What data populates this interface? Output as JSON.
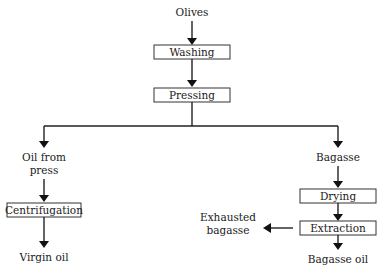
{
  "diagram": {
    "type": "flowchart",
    "nodes": {
      "olives": "Olives",
      "washing": "Washing",
      "pressing": "Pressing",
      "oil_from_press_1": "Oil from",
      "oil_from_press_2": "press",
      "centrifugation": "Centrifugation",
      "virgin_oil": "Virgin oil",
      "bagasse": "Bagasse",
      "drying": "Drying",
      "extraction": "Extraction",
      "exhausted_1": "Exhausted",
      "exhausted_2": "bagasse",
      "bagasse_oil": "Bagasse oil"
    },
    "edges": [
      [
        "Olives",
        "Washing"
      ],
      [
        "Washing",
        "Pressing"
      ],
      [
        "Pressing",
        "Oil from press"
      ],
      [
        "Pressing",
        "Bagasse"
      ],
      [
        "Oil from press",
        "Centrifugation"
      ],
      [
        "Centrifugation",
        "Virgin oil"
      ],
      [
        "Bagasse",
        "Drying"
      ],
      [
        "Drying",
        "Extraction"
      ],
      [
        "Extraction",
        "Exhausted bagasse"
      ],
      [
        "Extraction",
        "Bagasse oil"
      ]
    ]
  }
}
